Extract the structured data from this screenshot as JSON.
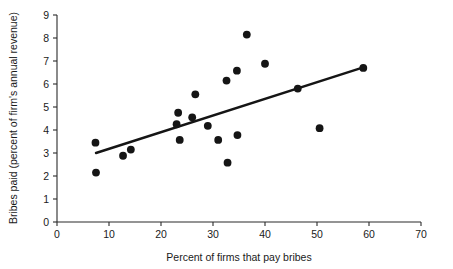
{
  "chart_data": {
    "type": "scatter",
    "title": "",
    "xlabel": "Percent of firms that pay bribes",
    "ylabel": "Bribes paid (percent of firm's annual revenue)",
    "xlim": [
      0,
      70
    ],
    "ylim": [
      0,
      9
    ],
    "xticks": [
      0,
      10,
      20,
      30,
      40,
      50,
      60,
      70
    ],
    "yticks": [
      0,
      1,
      2,
      3,
      4,
      5,
      6,
      7,
      8,
      9
    ],
    "grid": false,
    "legend": "none",
    "marker_color": "#151515",
    "trendline_color": "#151515",
    "points": [
      {
        "x": 7.4,
        "y": 3.45
      },
      {
        "x": 7.5,
        "y": 2.15
      },
      {
        "x": 12.7,
        "y": 2.88
      },
      {
        "x": 14.2,
        "y": 3.15
      },
      {
        "x": 23.0,
        "y": 4.25
      },
      {
        "x": 23.3,
        "y": 4.75
      },
      {
        "x": 23.6,
        "y": 3.57
      },
      {
        "x": 26.0,
        "y": 4.55
      },
      {
        "x": 26.6,
        "y": 5.55
      },
      {
        "x": 29.0,
        "y": 4.18
      },
      {
        "x": 31.0,
        "y": 3.57
      },
      {
        "x": 32.6,
        "y": 6.15
      },
      {
        "x": 32.8,
        "y": 2.58
      },
      {
        "x": 34.6,
        "y": 6.58
      },
      {
        "x": 34.7,
        "y": 3.78
      },
      {
        "x": 36.5,
        "y": 8.15
      },
      {
        "x": 40.0,
        "y": 6.88
      },
      {
        "x": 46.3,
        "y": 5.8
      },
      {
        "x": 50.5,
        "y": 4.08
      },
      {
        "x": 58.9,
        "y": 6.7
      }
    ],
    "trendline": {
      "x1": 7.5,
      "y1": 3.0,
      "x2": 58.9,
      "y2": 6.72
    }
  }
}
